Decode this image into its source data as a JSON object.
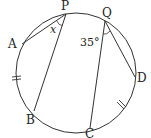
{
  "diagram": {
    "type": "circle-geometry",
    "circle": {
      "cx": 76,
      "cy": 73,
      "r": 60
    },
    "points": [
      {
        "id": "P",
        "label": "P",
        "x": 66,
        "y": 14,
        "lx": 61,
        "ly": 10
      },
      {
        "id": "Q",
        "label": "Q",
        "x": 105,
        "y": 21,
        "lx": 102,
        "ly": 17
      },
      {
        "id": "A",
        "label": "A",
        "x": 22,
        "y": 44,
        "lx": 8,
        "ly": 48
      },
      {
        "id": "D",
        "label": "D",
        "x": 135,
        "y": 77,
        "lx": 137,
        "ly": 82
      },
      {
        "id": "B",
        "label": "B",
        "x": 34,
        "y": 111,
        "lx": 26,
        "ly": 124
      },
      {
        "id": "C",
        "label": "C",
        "x": 90,
        "y": 128,
        "lx": 85,
        "ly": 138
      }
    ],
    "segments": [
      {
        "from": "P",
        "to": "A"
      },
      {
        "from": "P",
        "to": "B"
      },
      {
        "from": "Q",
        "to": "C"
      },
      {
        "from": "Q",
        "to": "D"
      }
    ],
    "angles": [
      {
        "vertex": "P",
        "label": "x",
        "italic": true,
        "lx": 50,
        "ly": 33
      },
      {
        "vertex": "Q",
        "label": "35°",
        "italic": false,
        "lx": 80,
        "ly": 45
      }
    ],
    "equal_arc_marks": [
      "arc AB",
      "arc CD"
    ]
  }
}
